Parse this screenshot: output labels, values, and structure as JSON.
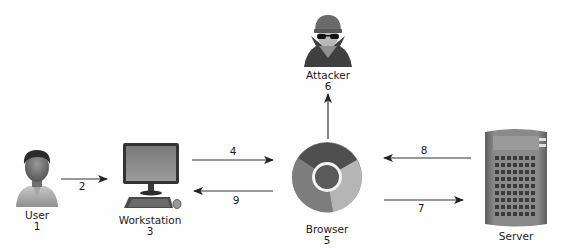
{
  "diagram": {
    "type": "flow",
    "colors": {
      "background": "#fefefe",
      "arrow": "#333333",
      "text": "#1a1a1a"
    },
    "nodes": [
      {
        "id": "user",
        "name": "User",
        "step": "1",
        "icon": "person-icon"
      },
      {
        "id": "workstation",
        "name": "Workstation",
        "step": "3",
        "icon": "desktop-computer-icon"
      },
      {
        "id": "browser",
        "name": "Browser",
        "step": "5",
        "icon": "chrome-browser-icon"
      },
      {
        "id": "attacker",
        "name": "Attacker",
        "step": "6",
        "icon": "hacker-spy-icon"
      },
      {
        "id": "server",
        "name": "Server",
        "step": "",
        "icon": "server-tower-icon"
      }
    ],
    "edges": [
      {
        "label": "2",
        "from": "User",
        "to": "Workstation"
      },
      {
        "label": "4",
        "from": "Workstation",
        "to": "Browser"
      },
      {
        "label": "9",
        "from": "Browser",
        "to": "Workstation"
      },
      {
        "label": "6",
        "from": "Browser",
        "to": "Attacker"
      },
      {
        "label": "8",
        "from": "Server",
        "to": "Browser"
      },
      {
        "label": "7",
        "from": "Browser",
        "to": "Server"
      }
    ]
  }
}
